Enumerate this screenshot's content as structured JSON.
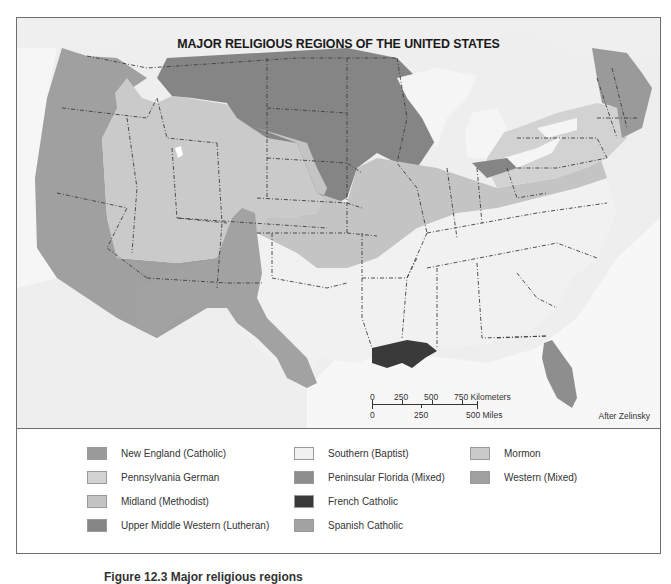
{
  "map": {
    "title": "MAJOR RELIGIOUS REGIONS OF THE UNITED STATES",
    "credit": "After Zelinsky",
    "scale": {
      "km_ticks": [
        "0",
        "250",
        "500",
        "750 Kilometers"
      ],
      "mi_ticks": [
        "0",
        "250",
        "500 Miles"
      ]
    }
  },
  "legend": {
    "items": [
      {
        "label": "New England (Catholic)",
        "color": "#9a9a9a"
      },
      {
        "label": "Pennsylvania German",
        "color": "#d2d2d2"
      },
      {
        "label": "Midland (Methodist)",
        "color": "#c4c4c4"
      },
      {
        "label": "Upper Middle Western (Lutheran)",
        "color": "#858585"
      },
      {
        "label": "Southern (Baptist)",
        "color": "#f1f1f1"
      },
      {
        "label": "Peninsular Florida (Mixed)",
        "color": "#8e8e8e"
      },
      {
        "label": "French Catholic",
        "color": "#3a3a3a"
      },
      {
        "label": "Spanish Catholic",
        "color": "#a2a2a2"
      },
      {
        "label": "Mormon",
        "color": "#cacaca"
      },
      {
        "label": "Western (Mixed)",
        "color": "#a0a0a0"
      }
    ]
  },
  "figure": {
    "caption": "Figure 12.3 Major religious regions"
  },
  "colors": {
    "water": "#f4f4f4",
    "foreign_land": "#ececec",
    "border": "#3d3d3d",
    "frame": "#6e6e6e"
  }
}
